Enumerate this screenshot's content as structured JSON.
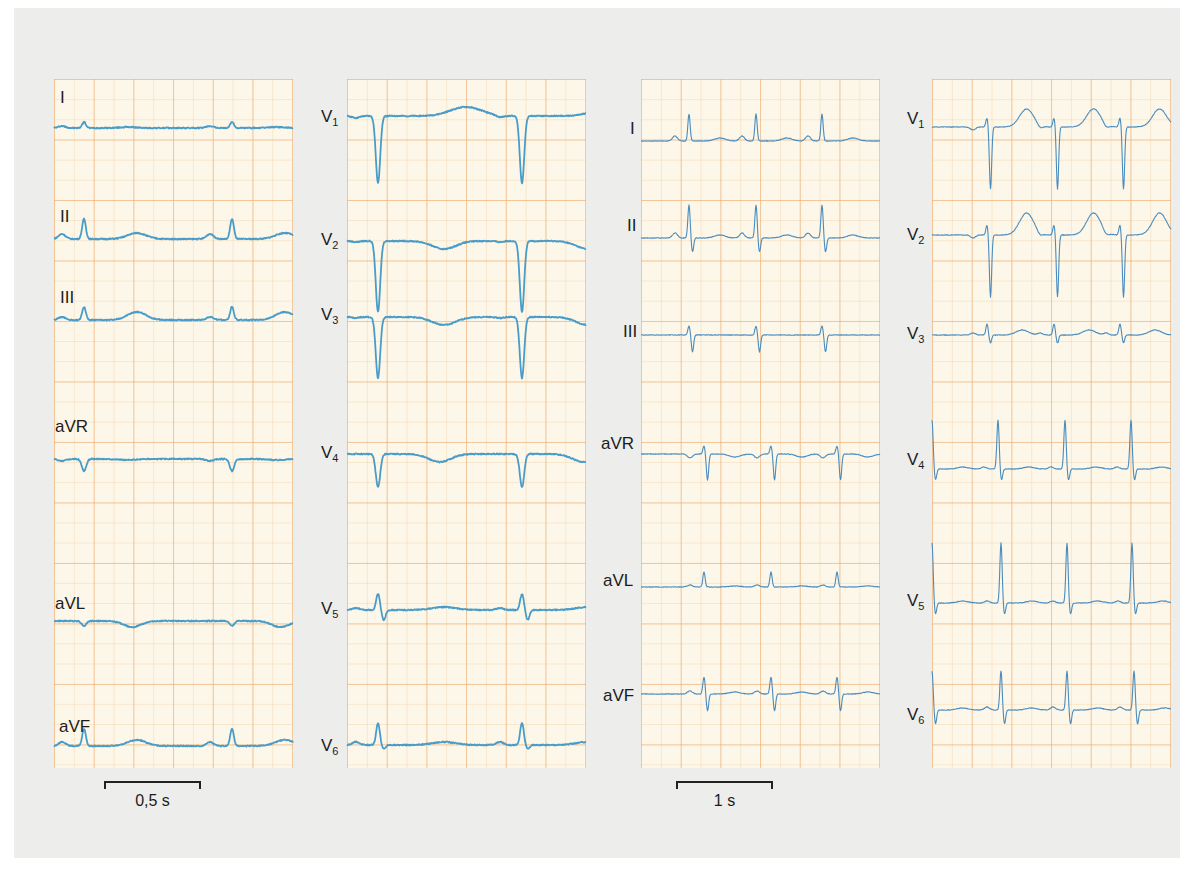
{
  "chart_data": {
    "type": "line",
    "title": "",
    "grid": true,
    "colors": {
      "paper": "#fdf7e9",
      "grid_major": "#eca96e",
      "grid_minor": "#f0c896",
      "trace_a": "#4a9cc8",
      "trace_b": "#4a8cbe",
      "background": "#ededec"
    },
    "panels": [
      {
        "id": "panel-1",
        "group": "recording-1",
        "leads": [
          {
            "label": "I",
            "sub": "",
            "y": 49,
            "beats": [
              30,
              178
            ],
            "qrs": {
              "r": 6,
              "s": 0,
              "q": 0
            },
            "t": {
              "h": 1,
              "w": 20
            },
            "p": {
              "h": 2
            }
          },
          {
            "label": "II",
            "sub": "",
            "y": 160,
            "beats": [
              30,
              178
            ],
            "qrs": {
              "r": 20,
              "s": 0,
              "q": 0
            },
            "t": {
              "h": 6,
              "w": 24
            },
            "p": {
              "h": 5
            }
          },
          {
            "label": "III",
            "sub": "",
            "y": 241,
            "beats": [
              30,
              178
            ],
            "qrs": {
              "r": 13,
              "s": 0,
              "q": 0
            },
            "t": {
              "h": 8,
              "w": 24
            },
            "p": {
              "h": 3
            }
          },
          {
            "label": "aVR",
            "sub": "",
            "y": 380,
            "beats": [
              30,
              178
            ],
            "qrs": {
              "r": 0,
              "s": 0,
              "q": -12
            },
            "t": {
              "h": -1,
              "w": 20
            },
            "p": {
              "h": -2
            }
          },
          {
            "label": "aVL",
            "sub": "",
            "y": 542,
            "beats": [
              30,
              178
            ],
            "qrs": {
              "r": 0,
              "s": 0,
              "q": -5
            },
            "t": {
              "h": -6,
              "w": 22
            },
            "p": {
              "h": 0
            }
          },
          {
            "label": "aVF",
            "sub": "",
            "y": 667,
            "beats": [
              30,
              178
            ],
            "qrs": {
              "r": 17,
              "s": 0,
              "q": 0
            },
            "t": {
              "h": 6,
              "w": 24
            },
            "p": {
              "h": 4
            }
          }
        ],
        "scale_bar": {
          "label": "0,5 s",
          "px": 96
        }
      },
      {
        "id": "panel-2",
        "group": "recording-1",
        "leads": [
          {
            "label": "V",
            "sub": "1",
            "y": 37,
            "beats": [
              31,
              175
            ],
            "qrs": {
              "r": 0,
              "s": 0,
              "q": -67
            },
            "t": {
              "h": 9,
              "w": 40
            },
            "p": {
              "h": -2
            }
          },
          {
            "label": "V",
            "sub": "2",
            "y": 162,
            "beats": [
              31,
              175
            ],
            "qrs": {
              "r": 0,
              "s": 0,
              "q": -71
            },
            "t": {
              "h": -8,
              "w": 30
            },
            "p": {
              "h": -1
            }
          },
          {
            "label": "V",
            "sub": "3",
            "y": 238,
            "beats": [
              31,
              175
            ],
            "qrs": {
              "r": 0,
              "s": 0,
              "q": -61
            },
            "t": {
              "h": -8,
              "w": 30
            },
            "p": {
              "h": -1
            }
          },
          {
            "label": "V",
            "sub": "4",
            "y": 375,
            "beats": [
              31,
              175
            ],
            "qrs": {
              "r": 0,
              "s": 0,
              "q": -33
            },
            "t": {
              "h": -8,
              "w": 28
            },
            "p": {
              "h": 0
            }
          },
          {
            "label": "V",
            "sub": "5",
            "y": 531,
            "beats": [
              31,
              175
            ],
            "qrs": {
              "r": 16,
              "s": -10,
              "q": 0
            },
            "t": {
              "h": 3,
              "w": 30
            },
            "p": {
              "h": 2
            }
          },
          {
            "label": "V",
            "sub": "6",
            "y": 666,
            "beats": [
              31,
              175
            ],
            "qrs": {
              "r": 22,
              "s": -4,
              "q": 0
            },
            "t": {
              "h": 3,
              "w": 30
            },
            "p": {
              "h": 3
            }
          }
        ]
      },
      {
        "id": "panel-3",
        "group": "recording-2",
        "leads": [
          {
            "label": "I",
            "sub": "",
            "y": 62,
            "beats": [
              48,
              115,
              181
            ],
            "qrs": {
              "r": 27,
              "s": 0,
              "q": 0
            },
            "t": {
              "h": 3,
              "w": 14
            },
            "p": {
              "h": 5
            }
          },
          {
            "label": "II",
            "sub": "",
            "y": 159,
            "beats": [
              48,
              115,
              181
            ],
            "qrs": {
              "r": 33,
              "s": -14,
              "q": 0
            },
            "t": {
              "h": 3,
              "w": 14
            },
            "p": {
              "h": 5
            }
          },
          {
            "label": "III",
            "sub": "",
            "y": 256,
            "beats": [
              48,
              115,
              181
            ],
            "qrs": {
              "r": 9,
              "s": -17,
              "q": 0
            },
            "t": {
              "h": 0,
              "w": 14
            },
            "p": {
              "h": 0
            }
          },
          {
            "label": "aVR",
            "sub": "",
            "y": 375,
            "beats": [
              63,
              130,
              196
            ],
            "qrs": {
              "r": 8,
              "s": -26,
              "q": 0
            },
            "t": {
              "h": -3,
              "w": 14
            },
            "p": {
              "h": -4
            }
          },
          {
            "label": "aVL",
            "sub": "",
            "y": 508,
            "beats": [
              63,
              130,
              196
            ],
            "qrs": {
              "r": 15,
              "s": 0,
              "q": 0
            },
            "t": {
              "h": 1,
              "w": 14
            },
            "p": {
              "h": 2
            }
          },
          {
            "label": "aVF",
            "sub": "",
            "y": 615,
            "beats": [
              63,
              130,
              196
            ],
            "qrs": {
              "r": 17,
              "s": -17,
              "q": 0
            },
            "t": {
              "h": 2,
              "w": 14
            },
            "p": {
              "h": 3
            }
          }
        ],
        "scale_bar": {
          "label": "1 s",
          "px": 96
        }
      },
      {
        "id": "panel-4",
        "group": "recording-2",
        "leads": [
          {
            "label": "V",
            "sub": "1",
            "y": 48,
            "beats": [
              55,
              122,
              188
            ],
            "qrs": {
              "r": 9,
              "s": -62,
              "q": 0
            },
            "t": {
              "h": 18,
              "w": 18
            },
            "p": {
              "h": -3
            }
          },
          {
            "label": "V",
            "sub": "2",
            "y": 156,
            "beats": [
              55,
              122,
              188
            ],
            "qrs": {
              "r": 10,
              "s": -62,
              "q": 0
            },
            "t": {
              "h": 22,
              "w": 18
            },
            "p": {
              "h": -3
            }
          },
          {
            "label": "V",
            "sub": "3",
            "y": 256,
            "beats": [
              55,
              122,
              188
            ],
            "qrs": {
              "r": 11,
              "s": -8,
              "q": 0
            },
            "t": {
              "h": 5,
              "w": 16
            },
            "p": {
              "h": 2
            }
          },
          {
            "label": "V",
            "sub": "4",
            "y": 390,
            "beats": [
              0,
              66,
              133,
              199
            ],
            "qrs": {
              "r": 49,
              "s": -11,
              "q": 0
            },
            "t": {
              "h": 2,
              "w": 14
            },
            "p": {
              "h": 2
            }
          },
          {
            "label": "V",
            "sub": "5",
            "y": 524,
            "beats": [
              0,
              69,
              135,
              200
            ],
            "qrs": {
              "r": 60,
              "s": -11,
              "q": 0
            },
            "t": {
              "h": 2,
              "w": 14
            },
            "p": {
              "h": 2
            }
          },
          {
            "label": "V",
            "sub": "6",
            "y": 631,
            "beats": [
              0,
              69,
              135,
              202
            ],
            "qrs": {
              "r": 39,
              "s": -14,
              "q": 0
            },
            "t": {
              "h": 2,
              "w": 14
            },
            "p": {
              "h": 3
            }
          }
        ]
      }
    ],
    "xlabel": "time",
    "scale_bars": [
      {
        "label": "0,5 s",
        "panel": "panel-1",
        "duration_s": 0.5
      },
      {
        "label": "1 s",
        "panel": "panel-3",
        "duration_s": 1
      }
    ]
  },
  "labels": {
    "p1": [
      "I",
      "II",
      "III",
      "aVR",
      "aVL",
      "aVF"
    ],
    "p2": [
      "V",
      "V",
      "V",
      "V",
      "V",
      "V"
    ],
    "p2_sub": [
      "1",
      "2",
      "3",
      "4",
      "5",
      "6"
    ],
    "p3": [
      "I",
      "II",
      "III",
      "aVR",
      "aVL",
      "aVF"
    ],
    "p4": [
      "V",
      "V",
      "V",
      "V",
      "V",
      "V"
    ],
    "p4_sub": [
      "1",
      "2",
      "3",
      "4",
      "5",
      "6"
    ]
  },
  "scale": {
    "left_label": "0,5 s",
    "right_label": "1 s"
  }
}
